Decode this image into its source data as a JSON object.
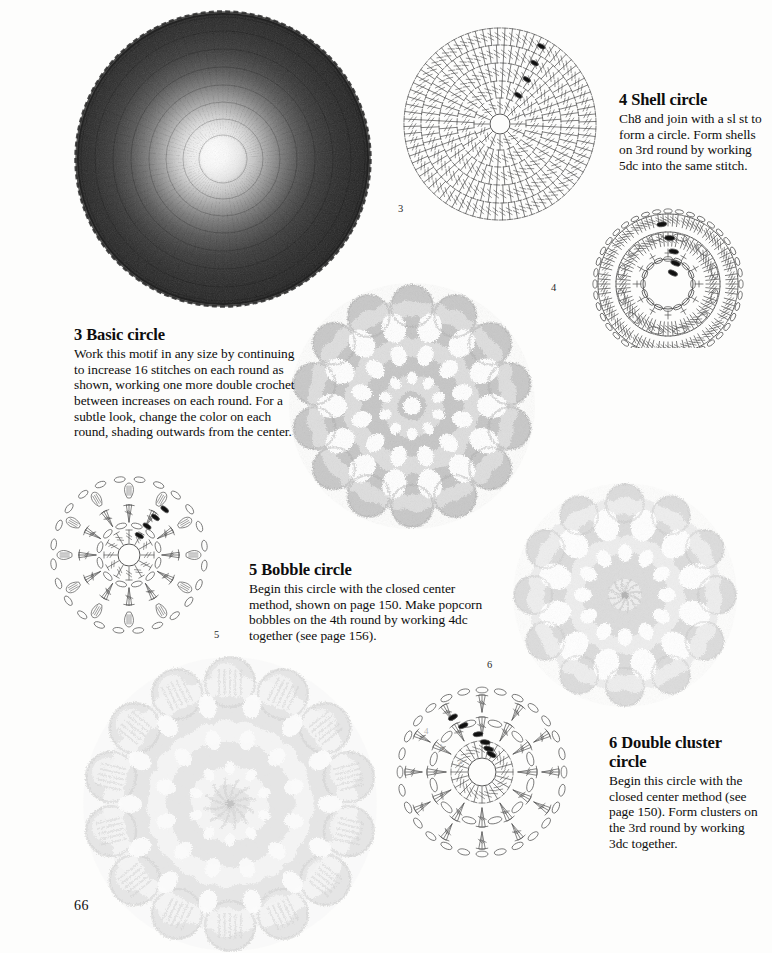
{
  "page": {
    "number": "66",
    "background_color": "#fdfdfc",
    "text_color": "#0d0d0d"
  },
  "sections": [
    {
      "id": "basic-circle",
      "number": "3",
      "heading": "3 Basic circle",
      "body": "Work this motif in any size by continuing to increase 16 stitches on each round as shown, working one more double crochet between increases on each round. For a subtle look, change the color on each round, shading outwards from the center.",
      "diagram_label": "3",
      "photo": {
        "name": "basic-circle-photo",
        "description": "dark crochet disc with bright white center shading outwards",
        "center_color": "#ffffff",
        "edge_color": "#2b2b2b"
      }
    },
    {
      "id": "shell-circle",
      "number": "4",
      "heading": "4 Shell circle",
      "body": "Ch8 and join with a sl st to form a circle. Form shells on 3rd round by working 5dc into the same stitch.",
      "diagram_label": "4",
      "photo": {
        "name": "shell-circle-photo",
        "description": "light grey openwork crochet circle with scalloped shell edge",
        "yarn_color": "#c9c9c9"
      }
    },
    {
      "id": "bobble-circle",
      "number": "5",
      "heading": "5 Bobble circle",
      "body": "Begin this circle with the closed center method, shown on page 150. Make popcorn bobbles on the 4th round by working 4dc together (see page 156).",
      "diagram_label": "5",
      "photo": {
        "name": "bobble-circle-photo",
        "description": "very pale crochet circle with raised popcorn bobbles around the edge",
        "yarn_color": "#e9e9e9"
      }
    },
    {
      "id": "double-cluster-circle",
      "number": "6",
      "heading": "6 Double cluster circle",
      "body": "Begin this circle with the closed center method (see page 150). Form clusters on the 3rd round by working 3dc together.",
      "diagram_label": "6",
      "photo": {
        "name": "double-cluster-circle-photo",
        "description": "pale grey lacy crochet circle with double cluster petals",
        "yarn_color": "#dcdcdc"
      }
    }
  ],
  "diagrams": {
    "basic_circle": {
      "name": "basic-circle-diagram",
      "rounds": 5,
      "stitch_counts": [
        16,
        32,
        48,
        64,
        80
      ],
      "symbol": "double-crochet",
      "marker_symbol": "chain-start-marker",
      "marker_count": 4
    },
    "shell_circle": {
      "name": "shell-circle-diagram",
      "rounds": 4,
      "shells_per_round": 12,
      "symbol": "shell-5dc",
      "marker_count": 5
    },
    "bobble_circle": {
      "name": "bobble-circle-diagram",
      "rounds": 4,
      "bobbles": 12,
      "symbol": "popcorn-bobble",
      "marker_count": 4
    },
    "double_cluster_circle": {
      "name": "double-cluster-circle-diagram",
      "rounds": 4,
      "clusters": 12,
      "symbol": "3dc-cluster",
      "round_labels": [
        "2",
        "3",
        "4"
      ],
      "marker_count": 6
    }
  }
}
